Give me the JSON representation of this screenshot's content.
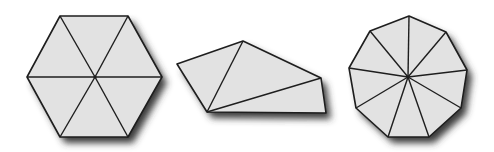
{
  "diagram": {
    "colors": {
      "background": "#ffffff",
      "fill": "#e2e2e2",
      "stroke": "#1e1e1e",
      "shadow": "#3a3a3a"
    },
    "shapes": [
      {
        "name": "hexagon",
        "sides": 6,
        "triangles": 6,
        "vertices": [
          [
            60,
            16
          ],
          [
            128,
            16
          ],
          [
            162,
            77
          ],
          [
            128,
            137
          ],
          [
            60,
            137
          ],
          [
            27,
            77
          ]
        ],
        "center": [
          95,
          77
        ]
      },
      {
        "name": "pentagon-irregular",
        "sides": 5,
        "triangles": 3,
        "vertices": [
          [
            177,
            64
          ],
          [
            243,
            41
          ],
          [
            321,
            78
          ],
          [
            326,
            113
          ],
          [
            207,
            112
          ]
        ],
        "diagonals": [
          [
            [
              207,
              112
            ],
            [
              243,
              41
            ]
          ],
          [
            [
              207,
              112
            ],
            [
              321,
              78
            ]
          ]
        ]
      },
      {
        "name": "nonagon",
        "sides": 9,
        "triangles": 9,
        "vertices": [
          [
            409,
            16
          ],
          [
            446,
            32
          ],
          [
            467,
            70
          ],
          [
            461,
            108
          ],
          [
            429,
            137
          ],
          [
            388,
            137
          ],
          [
            356,
            108
          ],
          [
            349,
            68
          ],
          [
            370,
            31
          ]
        ],
        "center": [
          408,
          77
        ]
      }
    ]
  }
}
